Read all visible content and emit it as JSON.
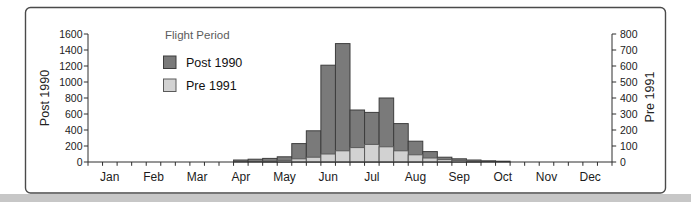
{
  "chart_data": {
    "type": "bar",
    "title": "Flight Period",
    "legend_position": "top-left-inside",
    "grid": false,
    "bars_per_month": 3,
    "x_axis": {
      "months": [
        "Jan",
        "Feb",
        "Mar",
        "Apr",
        "May",
        "Jun",
        "Jul",
        "Aug",
        "Sep",
        "Oct",
        "Nov",
        "Dec"
      ]
    },
    "left_axis": {
      "label": "Post 1990",
      "min": 0,
      "max": 1600,
      "step": 200,
      "ticks": [
        1600,
        1400,
        1200,
        1000,
        800,
        600,
        400,
        200,
        0
      ]
    },
    "right_axis": {
      "label": "Pre 1991",
      "min": 0,
      "max": 800,
      "step": 100,
      "ticks": [
        800,
        700,
        600,
        500,
        400,
        300,
        200,
        100,
        0
      ]
    },
    "series": [
      {
        "name": "Post 1990",
        "axis": "left",
        "color": "#7a7a7a",
        "border_color": "#3d3d3d",
        "values": [
          0,
          0,
          0,
          0,
          0,
          0,
          0,
          0,
          0,
          0,
          25,
          35,
          45,
          65,
          230,
          390,
          1210,
          1480,
          650,
          620,
          800,
          480,
          260,
          130,
          60,
          40,
          25,
          15,
          10,
          0,
          0,
          0,
          0,
          0,
          0,
          0
        ]
      },
      {
        "name": "Pre 1991",
        "axis": "right",
        "color": "#d2d2d2",
        "border_color": "#5a5a5a",
        "values": [
          0,
          0,
          0,
          0,
          0,
          0,
          0,
          0,
          0,
          0,
          0,
          0,
          5,
          10,
          20,
          30,
          50,
          70,
          90,
          110,
          95,
          70,
          45,
          25,
          15,
          10,
          5,
          0,
          0,
          0,
          0,
          0,
          0,
          0,
          0,
          0
        ]
      }
    ],
    "frame": {
      "border_color": "#4a4a4a",
      "background": "#ffffff",
      "bottom_strip_color": "#c7c7c7"
    }
  }
}
